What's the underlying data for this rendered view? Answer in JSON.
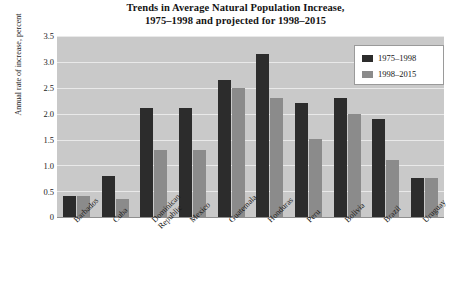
{
  "chart_data": {
    "type": "bar",
    "title": "Trends in Average Natural Population Increase,\n1975–1998 and projected for 1998–2015",
    "title_line1": "Trends in Average Natural Population Increase,",
    "title_line2": "1975–1998 and projected for 1998–2015",
    "xlabel": "",
    "ylabel": "Annual rate of increase, percent",
    "ylim": [
      0,
      3.5
    ],
    "ytick_labels": [
      "3.5",
      "3.0",
      "2.5",
      "2.0",
      "1.5",
      "1.0",
      "0.5",
      "0"
    ],
    "ytick_values": [
      3.5,
      3.0,
      2.5,
      2.0,
      1.5,
      1.0,
      0.5,
      0
    ],
    "grid": true,
    "legend_position": "top-right",
    "categories": [
      "Barbados",
      "Cuba",
      "Dominican Republic",
      "Mexico",
      "Guatemala",
      "Honduras",
      "Peru",
      "Bolivia",
      "Brazil",
      "Uruguay"
    ],
    "category_label_lines": [
      [
        "Barbados"
      ],
      [
        "Cuba"
      ],
      [
        "Dominican",
        "Republic"
      ],
      [
        "Mexico"
      ],
      [
        "Guatemala"
      ],
      [
        "Honduras"
      ],
      [
        "Peru"
      ],
      [
        "Bolivia"
      ],
      [
        "Brazil"
      ],
      [
        "Uruguay"
      ]
    ],
    "series": [
      {
        "name": "1975–1998",
        "color": "#2c2c2c",
        "values": [
          0.4,
          0.8,
          2.1,
          2.1,
          2.65,
          3.15,
          2.2,
          2.3,
          1.9,
          0.75
        ]
      },
      {
        "name": "1998–2015",
        "color": "#8b8b8b",
        "values": [
          0.4,
          0.35,
          1.3,
          1.3,
          2.5,
          2.3,
          1.5,
          2.0,
          1.1,
          0.75
        ]
      }
    ]
  },
  "colors": {
    "plot_background": "#c9c9c9",
    "gridline": "#e9e9e9",
    "series_a": "#2c2c2c",
    "series_b": "#8b8b8b",
    "legend_background": "#ffffff",
    "legend_border": "#9a9a9a",
    "text": "#1a1a1a"
  }
}
